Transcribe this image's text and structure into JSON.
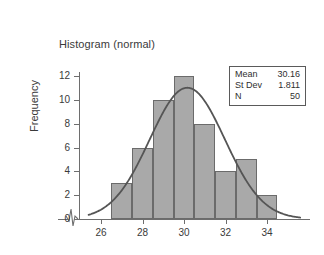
{
  "chart_data": {
    "type": "bar",
    "title": "Histogram (normal)",
    "xlabel": "",
    "ylabel": "Frequency",
    "categories": [
      27,
      28,
      29,
      30,
      31,
      32,
      33,
      34
    ],
    "values": [
      3,
      6,
      10,
      12,
      8,
      4,
      5,
      2
    ],
    "bin_width": 1,
    "bin_edges": [
      26.5,
      27.5,
      28.5,
      29.5,
      30.5,
      31.5,
      32.5,
      33.5,
      34.5
    ],
    "xlim": [
      25.4,
      35.6
    ],
    "ylim": [
      0,
      13
    ],
    "x_ticks": [
      26,
      28,
      30,
      32,
      34
    ],
    "y_ticks": [
      0,
      2,
      4,
      6,
      8,
      10,
      12
    ],
    "grid": false,
    "legend": "none",
    "axis_break": true,
    "bar_color": "#a9a9a9",
    "bar_edge_color": "#6b6b6b",
    "curve_color": "#555555",
    "overlay": {
      "type": "normal-curve",
      "mean": 30.16,
      "std_dev": 1.811,
      "n": 50,
      "scale_note": "density x N x bin_width"
    },
    "annotations": {
      "stats_box": [
        {
          "label": "Mean",
          "value": "30.16"
        },
        {
          "label": "St Dev",
          "value": "1.811"
        },
        {
          "label": "N",
          "value": "50"
        }
      ]
    }
  }
}
